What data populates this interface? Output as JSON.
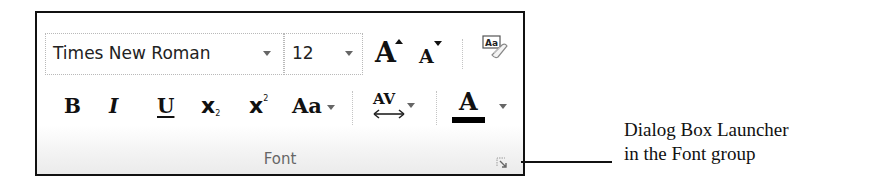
{
  "font_group": {
    "label": "Font",
    "font_name": {
      "value": "Times New Roman"
    },
    "font_size": {
      "value": "12"
    },
    "buttons": {
      "grow_font": "A",
      "shrink_font": "A",
      "clear_formatting": "Aa",
      "bold": "B",
      "italic": "I",
      "underline": "U",
      "subscript": "x",
      "subscript_mark": "2",
      "superscript": "x",
      "superscript_mark": "2",
      "change_case": "Aa",
      "character_spacing": "AV",
      "font_color": "A"
    },
    "colors": {
      "font_color_bar": "#000000",
      "frame_border": "#111111",
      "group_label": "#666666"
    },
    "dialog_launcher": "dialog-box-launcher-icon"
  },
  "annotation": {
    "line1": "Dialog Box Launcher",
    "line2": "in the Font group"
  }
}
